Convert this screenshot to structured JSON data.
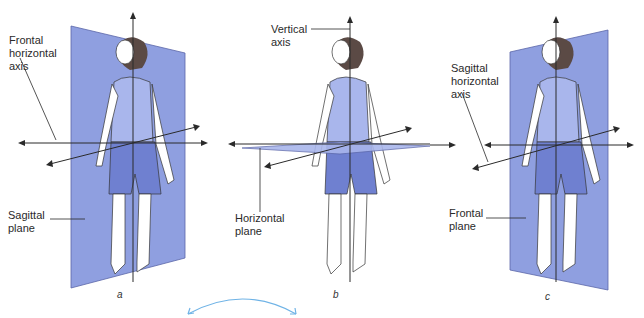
{
  "figure": {
    "panels": [
      {
        "id": "a",
        "caption": "a",
        "labels": {
          "axis": "Frontal\nhorizontal\naxis",
          "plane": "Sagittal\nplane"
        }
      },
      {
        "id": "b",
        "caption": "b",
        "labels": {
          "axis": "Vertical\naxis",
          "plane": "Horizontal\nplane"
        }
      },
      {
        "id": "c",
        "caption": "c",
        "labels": {
          "axis": "Sagittal\nhorizontal\naxis",
          "plane": "Frontal\nplane"
        }
      }
    ],
    "colors": {
      "plane": "#8f9fe0",
      "plane_edge": "#5a66a8",
      "shorts": "#6f80d0",
      "top": "#a9b6ec",
      "hair": "#5b4a45",
      "annotation": "#6fb3e6",
      "line": "#2a2a2a"
    }
  }
}
